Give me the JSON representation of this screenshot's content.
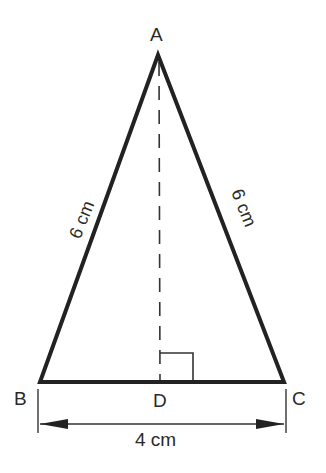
{
  "diagram": {
    "type": "isosceles-triangle",
    "vertices": {
      "A": {
        "label": "A",
        "x": 158,
        "y": 55
      },
      "B": {
        "label": "B",
        "x": 40,
        "y": 382
      },
      "C": {
        "label": "C",
        "x": 284,
        "y": 382
      },
      "D": {
        "label": "D",
        "x": 160,
        "y": 382
      }
    },
    "side_labels": {
      "AB": "6 cm",
      "AC": "6 cm",
      "BC": "4 cm"
    },
    "altitude": {
      "from": "A",
      "to": "D",
      "style": "dashed"
    },
    "right_angle_marker": "D",
    "colors": {
      "line": "#222222",
      "background": "#ffffff"
    }
  }
}
